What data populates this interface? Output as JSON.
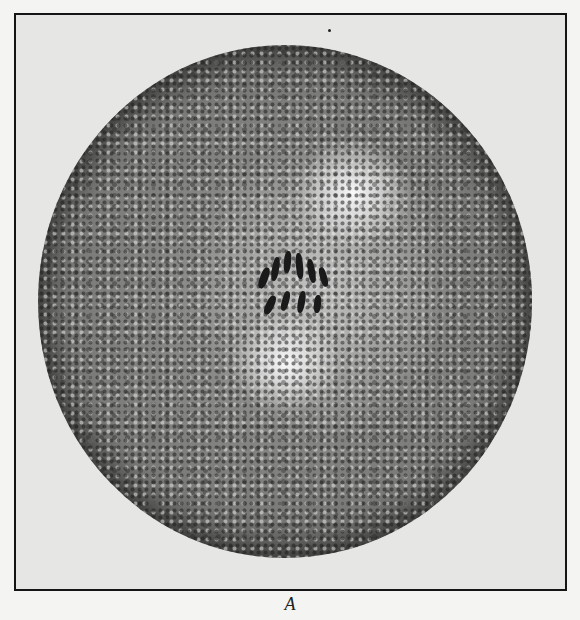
{
  "figure": {
    "caption": "A",
    "colors": {
      "background": "#f4f4f2",
      "frame_border": "#151515",
      "frame_fill": "#e6e6e4"
    }
  }
}
